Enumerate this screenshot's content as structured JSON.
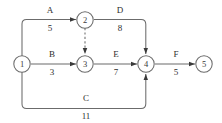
{
  "diagram": {
    "type": "activity-on-arrow-network",
    "stroke_color": "#6b6b6b",
    "text_color": "#2e2e2e",
    "background_color": "#ffffff",
    "nodes": [
      {
        "id": "1",
        "label": "1",
        "cx": 22,
        "cy": 64
      },
      {
        "id": "2",
        "label": "2",
        "cx": 85,
        "cy": 20
      },
      {
        "id": "3",
        "label": "3",
        "cx": 85,
        "cy": 64
      },
      {
        "id": "4",
        "label": "4",
        "cx": 146,
        "cy": 64
      },
      {
        "id": "5",
        "label": "5",
        "cx": 204,
        "cy": 64
      }
    ],
    "edges": [
      {
        "id": "A",
        "name": "A",
        "duration": "5",
        "from": "1",
        "to": "2",
        "style": "solid",
        "name_x": 50,
        "name_y": 13,
        "duration_x": 50,
        "duration_y": 31
      },
      {
        "id": "D",
        "name": "D",
        "duration": "8",
        "from": "2",
        "to": "4",
        "style": "solid",
        "name_x": 120,
        "name_y": 13,
        "duration_x": 120,
        "duration_y": 31
      },
      {
        "id": "B",
        "name": "B",
        "duration": "3",
        "from": "1",
        "to": "3",
        "style": "solid",
        "name_x": 52,
        "name_y": 57,
        "duration_x": 52,
        "duration_y": 75
      },
      {
        "id": "E",
        "name": "E",
        "duration": "7",
        "from": "3",
        "to": "4",
        "style": "solid",
        "name_x": 116,
        "name_y": 57,
        "duration_x": 116,
        "duration_y": 75
      },
      {
        "id": "F",
        "name": "F",
        "duration": "5",
        "from": "4",
        "to": "5",
        "style": "solid",
        "name_x": 176,
        "name_y": 57,
        "duration_x": 176,
        "duration_y": 75
      },
      {
        "id": "C",
        "name": "C",
        "duration": "11",
        "from": "1",
        "to": "4",
        "style": "solid",
        "name_x": 86,
        "name_y": 101,
        "duration_x": 86,
        "duration_y": 119
      },
      {
        "id": "dummy-2-3",
        "name": "",
        "duration": "",
        "from": "2",
        "to": "3",
        "style": "dashed",
        "name_x": 0,
        "name_y": 0,
        "duration_x": 0,
        "duration_y": 0
      }
    ]
  }
}
